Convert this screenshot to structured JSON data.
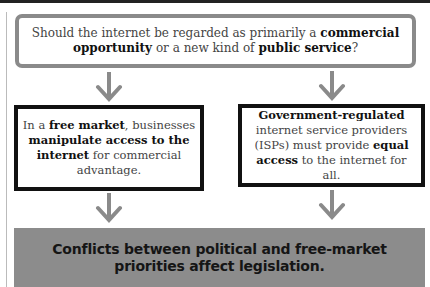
{
  "question": {
    "t1": "Should the internet be regarded as primarily a ",
    "b1": "commercial opportunity",
    "t2": " or a new kind of ",
    "b2": "public service",
    "t3": "?"
  },
  "left_box": {
    "t1": "In a ",
    "b1": "free market",
    "t2": ", businesses ",
    "b2": "manipulate access to the internet",
    "t3": " for commercial advantage."
  },
  "right_box": {
    "b1": "Government-regulated",
    "t1": " internet service providers (ISPs) must provide ",
    "b2": "equal access",
    "t2": " to the internet for all."
  },
  "result": {
    "text": "Conflicts between political and free-market priorities affect legislation."
  },
  "colors": {
    "arrow": "#8a8a8a",
    "question_border": "#8a8a8a",
    "box_border": "#111111",
    "result_bg": "#8c8c8c"
  }
}
